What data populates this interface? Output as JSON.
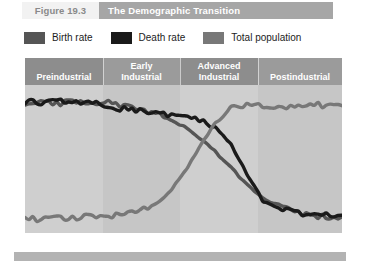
{
  "header": {
    "figure_number": "Figure 19.3",
    "title": "The Demographic Transition",
    "number_bg": "#f2f2f2",
    "number_color": "#8a8a8a",
    "title_bg": "#a6a6a6",
    "title_color": "#ffffff"
  },
  "legend": {
    "items": [
      {
        "label": "Birth rate",
        "color": "#555555",
        "icon": "legend-swatch-icon"
      },
      {
        "label": "Death rate",
        "color": "#1a1a1a",
        "icon": "legend-swatch-icon"
      },
      {
        "label": "Total population",
        "color": "#787878",
        "icon": "legend-swatch-icon"
      }
    ]
  },
  "chart_data": {
    "type": "line",
    "title": "The Demographic Transition",
    "xlabel": "",
    "ylabel": "",
    "grid": false,
    "legend_position": "above-plot",
    "x": [
      0,
      5,
      10,
      15,
      20,
      25,
      30,
      35,
      40,
      45,
      50,
      55,
      60,
      65,
      70,
      75,
      80,
      85,
      90,
      95,
      100
    ],
    "xlim": [
      0,
      100
    ],
    "ylim": [
      0,
      100
    ],
    "phases": [
      {
        "label": "Preindustrial",
        "x_start": 0,
        "x_end": 24.6,
        "band_color": "#8d8d8d",
        "plot_color": "#cfcfcf"
      },
      {
        "label": "Early\nIndustrial",
        "x_start": 24.6,
        "x_end": 48.9,
        "band_color": "#9b9b9b",
        "plot_color": "#c6c6c6"
      },
      {
        "label": "Advanced\nIndustrial",
        "x_start": 48.9,
        "x_end": 73.5,
        "band_color": "#8d8d8d",
        "plot_color": "#cfcfcf"
      },
      {
        "label": "Postindustrial",
        "x_start": 73.5,
        "x_end": 100,
        "band_color": "#9b9b9b",
        "plot_color": "#c6c6c6"
      }
    ],
    "series": [
      {
        "name": "Birth rate",
        "color": "#555555",
        "values": [
          88,
          90,
          87,
          90,
          86,
          89,
          86,
          84,
          82,
          78,
          72,
          64,
          55,
          44,
          33,
          24,
          18,
          14,
          12,
          11,
          11
        ]
      },
      {
        "name": "Death rate",
        "color": "#1a1a1a",
        "values": [
          89,
          88,
          89,
          88,
          89,
          87,
          84,
          83,
          82,
          80,
          78,
          76,
          72,
          60,
          40,
          22,
          16,
          14,
          13,
          12,
          12
        ]
      },
      {
        "name": "Total population",
        "color": "#787878",
        "values": [
          10,
          9,
          11,
          10,
          12,
          11,
          12,
          14,
          18,
          26,
          40,
          58,
          74,
          84,
          87,
          86,
          85,
          86,
          87,
          86,
          86
        ]
      }
    ]
  },
  "bottom_rule": {
    "color": "#b3b3b3"
  }
}
